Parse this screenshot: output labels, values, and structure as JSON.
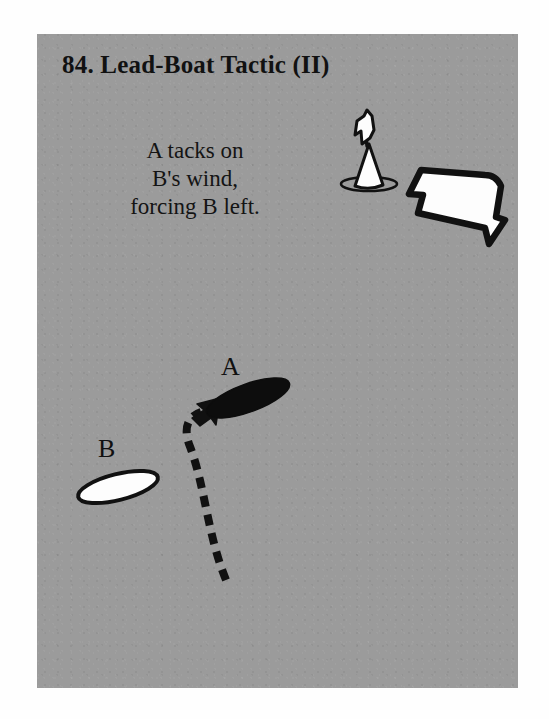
{
  "page": {
    "background_color": "#ffffff"
  },
  "panel": {
    "background_color": "#9b9b9b",
    "title": "84.  Lead-Boat Tactic (II)",
    "caption_lines": [
      "A tacks on",
      "B's wind,",
      "forcing B left."
    ]
  },
  "diagram": {
    "ink_color": "#111111",
    "boats": [
      {
        "name": "boat-a",
        "label": "A",
        "fill": "black",
        "fill_color": "#0d0d0d",
        "center": [
          248,
          398
        ],
        "rx": 44,
        "ry": 14,
        "rotation_deg": -20
      },
      {
        "name": "boat-b",
        "label": "B",
        "fill": "white",
        "fill_color": "#fdfdfd",
        "center": [
          118,
          487
        ],
        "rx": 41,
        "ry": 13,
        "rotation_deg": -14
      }
    ],
    "track": {
      "name": "tack-path",
      "style": "dashed",
      "dash": "11 8",
      "stroke_width": 8,
      "start": [
        226,
        580
      ],
      "end": [
        200,
        410
      ],
      "arrowhead": true
    },
    "wind_arrow": {
      "name": "wind-arrow",
      "direction": "left",
      "fill_color": "#fdfdfd",
      "stroke_color": "#0d0d0d"
    },
    "mark_buoy": {
      "name": "mark-buoy-with-flag",
      "fill_color": "#fdfdfd",
      "stroke_color": "#0d0d0d",
      "position": [
        372,
        185
      ]
    }
  }
}
